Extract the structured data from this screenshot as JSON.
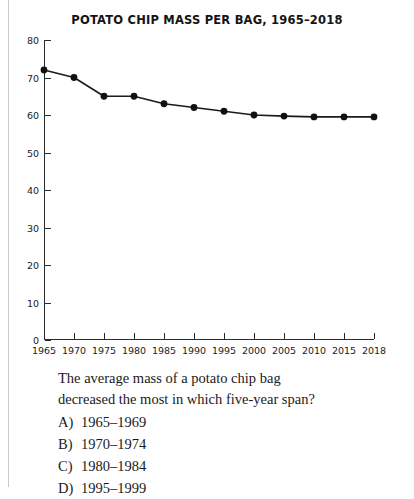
{
  "chart_data": {
    "type": "line",
    "title": "POTATO CHIP MASS PER BAG, 1965–2018",
    "xlabel": "",
    "ylabel": "",
    "x": [
      1965,
      1970,
      1975,
      1980,
      1985,
      1990,
      1995,
      2000,
      2005,
      2010,
      2015,
      2018
    ],
    "values": [
      72,
      70,
      65,
      65,
      63,
      62,
      61,
      60,
      59.7,
      59.5,
      59.5,
      59.5
    ],
    "xtick_labels": [
      "1965",
      "1970",
      "1975",
      "1980",
      "1985",
      "1990",
      "1995",
      "2000",
      "2005",
      "2010",
      "2015",
      "2018"
    ],
    "ytick_labels": [
      "0",
      "10",
      "20",
      "30",
      "40",
      "50",
      "60",
      "70",
      "80"
    ],
    "ytick_values": [
      0,
      10,
      20,
      30,
      40,
      50,
      60,
      70,
      80
    ],
    "ylim": [
      0,
      80
    ],
    "grid": false,
    "legend": false,
    "marker": "filled-circle",
    "line_color": "#1a1a1a",
    "marker_color": "#111111"
  },
  "question": {
    "stem_line1": "The average mass of a potato chip bag",
    "stem_line2": "decreased the most in which five-year span?",
    "choices": [
      {
        "letter": "A)",
        "text": "1965–1969"
      },
      {
        "letter": "B)",
        "text": "1970–1974"
      },
      {
        "letter": "C)",
        "text": "1980–1984"
      },
      {
        "letter": "D)",
        "text": "1995–1999"
      }
    ]
  }
}
